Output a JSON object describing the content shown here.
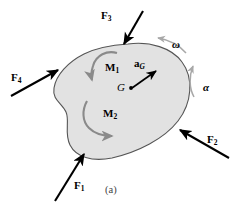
{
  "figure": {
    "caption": "(a)",
    "body_fill_color": "#e2e2e2",
    "body_stroke_color": "#555555",
    "force_arrow_color": "#000000",
    "moment_arrow_color": "#8a8a8a",
    "kinematic_arrow_color": "#a8a8a8"
  },
  "forces": [
    {
      "name": "force-1",
      "label": "F",
      "subscript": "1",
      "label_x": 74,
      "label_y": 180,
      "direction": "up-right",
      "tail": [
        55,
        201
      ],
      "head": [
        84,
        154
      ]
    },
    {
      "name": "force-2",
      "label": "F",
      "subscript": "2",
      "label_x": 207,
      "label_y": 134,
      "direction": "up-left",
      "tail": [
        229,
        158
      ],
      "head": [
        179,
        129
      ]
    },
    {
      "name": "force-3",
      "label": "F",
      "subscript": "3",
      "label_x": 101,
      "label_y": 10,
      "direction": "down-left",
      "tail": [
        143,
        11
      ],
      "head": [
        123,
        45
      ]
    },
    {
      "name": "force-4",
      "label": "F",
      "subscript": "4",
      "label_x": 11,
      "label_y": 72,
      "direction": "up-right",
      "tail": [
        11,
        96
      ],
      "head": [
        59,
        69
      ]
    }
  ],
  "moments": [
    {
      "name": "moment-1",
      "label": "M",
      "subscript": "1",
      "label_x": 105,
      "label_y": 62,
      "sense": "counterclockwise"
    },
    {
      "name": "moment-2",
      "label": "M",
      "subscript": "2",
      "label_x": 103,
      "label_y": 108,
      "sense": "clockwise"
    }
  ],
  "kinematics": {
    "mass_center": {
      "label": "G",
      "label_x": 117,
      "label_y": 82,
      "point": [
        131,
        88
      ]
    },
    "acceleration": {
      "label": "a",
      "subscript": "G",
      "label_x": 134,
      "label_y": 58,
      "tail": [
        132,
        88
      ],
      "head": [
        156,
        71
      ]
    },
    "angular_velocity": {
      "label": "ω",
      "label_x": 172,
      "label_y": 39
    },
    "angular_acceleration": {
      "label": "α",
      "label_x": 203,
      "label_y": 82
    }
  }
}
